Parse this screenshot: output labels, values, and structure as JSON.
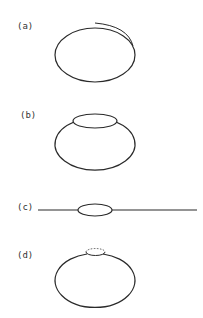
{
  "figure": {
    "panels": [
      {
        "id": "a",
        "label": "(a)",
        "description": "ellipse with an outer arc along its upper-right edge"
      },
      {
        "id": "b",
        "label": "(b)",
        "description": "ellipse with a flattened top cap ellipse"
      },
      {
        "id": "c",
        "label": "(c)",
        "description": "horizontal line through a small flat ellipse"
      },
      {
        "id": "d",
        "label": "(d)",
        "description": "ellipse with a small cap at top, upper half dashed"
      }
    ],
    "colors": {
      "stroke": "#2a2a2a",
      "background": "#ffffff"
    }
  }
}
